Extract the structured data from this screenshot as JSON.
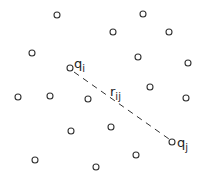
{
  "diagram": {
    "title": "",
    "particles": [
      {
        "x": 57,
        "y": 15
      },
      {
        "x": 143,
        "y": 14
      },
      {
        "x": 113,
        "y": 32
      },
      {
        "x": 169,
        "y": 32
      },
      {
        "x": 32,
        "y": 53
      },
      {
        "x": 138,
        "y": 57
      },
      {
        "x": 188,
        "y": 63
      },
      {
        "x": 70,
        "y": 68,
        "label": "q",
        "sub": "i"
      },
      {
        "x": 18,
        "y": 97
      },
      {
        "x": 50,
        "y": 96
      },
      {
        "x": 88,
        "y": 99
      },
      {
        "x": 150,
        "y": 87
      },
      {
        "x": 186,
        "y": 98
      },
      {
        "x": 71,
        "y": 131
      },
      {
        "x": 111,
        "y": 127
      },
      {
        "x": 172,
        "y": 142,
        "label": "q",
        "sub": "j"
      },
      {
        "x": 35,
        "y": 160
      },
      {
        "x": 96,
        "y": 167
      },
      {
        "x": 136,
        "y": 155
      }
    ],
    "connector": {
      "from_label": "q_i",
      "to_label": "q_j",
      "style": "dashed",
      "label": "r",
      "sub": "ij"
    },
    "labels": {
      "qi": "q",
      "qi_sub": "i",
      "qj": "q",
      "qj_sub": "j",
      "rij": "r",
      "rij_sub": "ij"
    },
    "colors": {
      "stroke": "#333333",
      "background": "#ffffff"
    }
  }
}
